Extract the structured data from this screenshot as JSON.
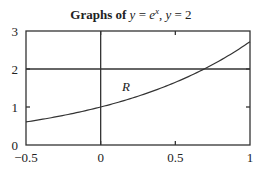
{
  "chart_data": {
    "type": "line",
    "title_parts": {
      "bold_prefix": "Graphs of ",
      "eq1_var": "y",
      "eq1_eq": " = ",
      "eq1_base": "e",
      "eq1_exp": "x",
      "sep": ", ",
      "eq2_var": "y",
      "eq2_rest": " = 2"
    },
    "xlabel": "",
    "ylabel": "",
    "xlim": [
      -0.5,
      1
    ],
    "ylim": [
      0,
      3
    ],
    "grid": false,
    "x_ticks": [
      {
        "value": -0.5,
        "label": "−0.5"
      },
      {
        "value": 0,
        "label": "0"
      },
      {
        "value": 0.5,
        "label": "0.5"
      },
      {
        "value": 1,
        "label": "1"
      }
    ],
    "y_ticks": [
      {
        "value": 0,
        "label": "0"
      },
      {
        "value": 1,
        "label": "1"
      },
      {
        "value": 2,
        "label": "2"
      },
      {
        "value": 3,
        "label": "3"
      }
    ],
    "series": [
      {
        "name": "y = e^x",
        "function": "exp",
        "x": [
          -0.5,
          -0.25,
          0,
          0.25,
          0.5,
          0.693,
          0.75,
          1
        ],
        "y": [
          0.607,
          0.779,
          1.0,
          1.284,
          1.649,
          2.0,
          2.117,
          2.718
        ]
      },
      {
        "name": "y = 2",
        "function": "constant",
        "x": [
          -0.5,
          1
        ],
        "y": [
          2,
          2
        ]
      }
    ],
    "reference_lines": [
      {
        "orientation": "vertical",
        "value": 0
      }
    ],
    "annotations": [
      {
        "text": "R",
        "x": 0.17,
        "y": 1.55
      }
    ]
  }
}
